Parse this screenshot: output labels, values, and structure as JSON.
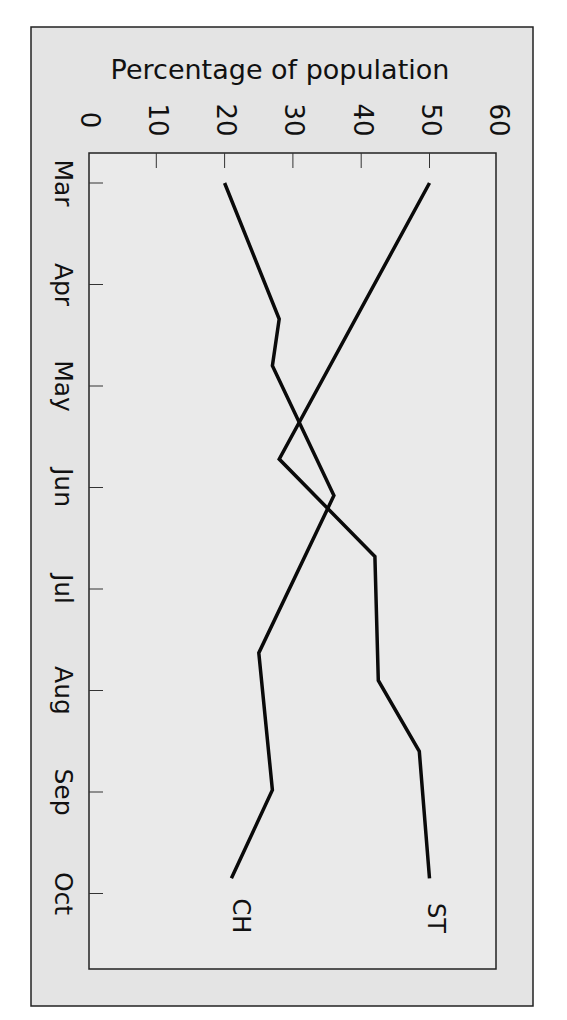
{
  "chart_data": {
    "type": "line",
    "orientation": "rotated 90° clockwise (page viewed sideways)",
    "title": "",
    "ylabel": "Percentage of population",
    "xlabel": "",
    "categories": [
      "Mar",
      "Apr",
      "May",
      "Jun",
      "Jul",
      "Aug",
      "Sep",
      "Oct"
    ],
    "ylim": [
      0,
      60
    ],
    "yticks": [
      0,
      10,
      20,
      30,
      40,
      50,
      60
    ],
    "grid": false,
    "legend": "inline labels at line ends",
    "series": [
      {
        "name": "ST",
        "points": [
          {
            "month_pos": 0.0,
            "value": 50
          },
          {
            "month_pos": 2.72,
            "value": 28
          },
          {
            "month_pos": 3.68,
            "value": 42
          },
          {
            "month_pos": 4.9,
            "value": 42.5
          },
          {
            "month_pos": 5.6,
            "value": 48.5
          },
          {
            "month_pos": 6.85,
            "value": 50
          }
        ]
      },
      {
        "name": "CH",
        "points": [
          {
            "month_pos": 0.0,
            "value": 20
          },
          {
            "month_pos": 1.34,
            "value": 28
          },
          {
            "month_pos": 1.8,
            "value": 27
          },
          {
            "month_pos": 3.08,
            "value": 36
          },
          {
            "month_pos": 4.63,
            "value": 25
          },
          {
            "month_pos": 5.98,
            "value": 27
          },
          {
            "month_pos": 6.85,
            "value": 21
          }
        ]
      }
    ]
  },
  "labels": {
    "ylabel": "Percentage of population",
    "series_st": "ST",
    "series_ch": "CH"
  }
}
